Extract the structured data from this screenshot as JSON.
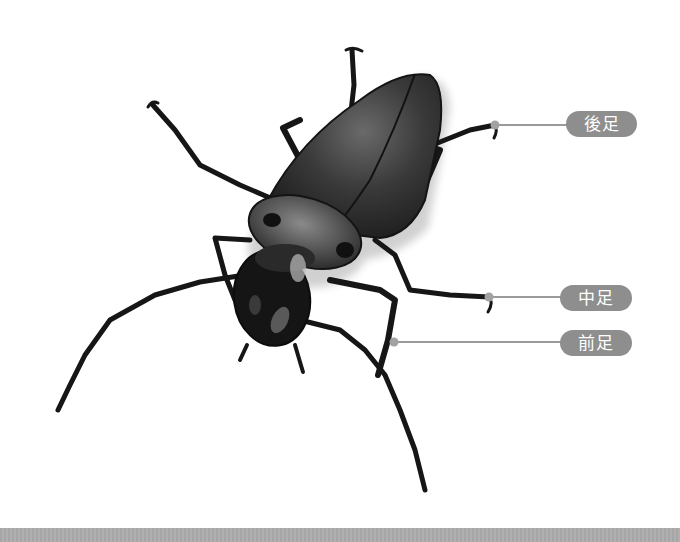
{
  "figure": {
    "labels": [
      {
        "id": "hind-leg",
        "text": "後足",
        "meaning": "hind leg"
      },
      {
        "id": "middle-leg",
        "text": "中足",
        "meaning": "middle leg"
      },
      {
        "id": "front-leg",
        "text": "前足",
        "meaning": "front leg"
      }
    ]
  },
  "colors": {
    "background": "#ffffff",
    "pill": "#8e8e8e",
    "pill_text": "#ffffff",
    "leader": "#9a9a9a",
    "beetle": "#1a1a1a",
    "bottom_band": "#aaaaaa"
  }
}
